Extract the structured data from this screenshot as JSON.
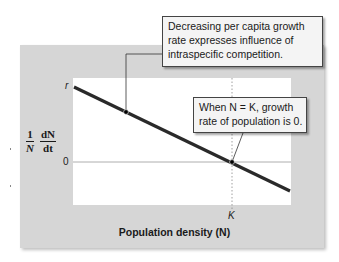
{
  "diagram": {
    "colors": {
      "panel_bg": "#d6d6d6",
      "plot_bg": "#ffffff",
      "line": "#2a2a2a",
      "callout_bg": "#f4f4f4",
      "callout_border": "#444444"
    },
    "y_axis": {
      "label_numerator_left": "1",
      "label_denominator_left": "N",
      "label_numerator_right": "dN",
      "label_denominator_right": "dt",
      "ticks": [
        {
          "label": "r",
          "position": "top"
        },
        {
          "label": "0",
          "position": "zero-line"
        }
      ]
    },
    "x_axis": {
      "label": "Population density (N)",
      "ticks": [
        {
          "label": "K",
          "position": "carrying-capacity"
        }
      ]
    },
    "series": {
      "name": "per capita growth rate",
      "type": "line",
      "start": {
        "x": 0,
        "y": "r"
      },
      "crosses_zero_at": "K",
      "slope": "negative"
    },
    "callouts": [
      {
        "id": "competition",
        "lines": [
          "Decreasing per capita growth",
          "rate expresses influence of",
          "intraspecific competition."
        ],
        "points_to": "line midpoint"
      },
      {
        "id": "carrying-capacity",
        "lines": [
          "When N = K, growth",
          "rate of population is 0."
        ],
        "points_to": "line at K, zero"
      }
    ]
  }
}
